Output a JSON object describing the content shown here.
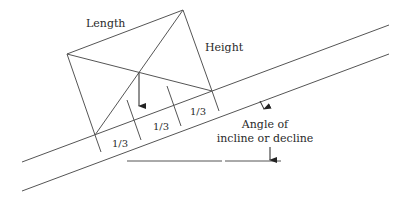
{
  "labels": {
    "length": "Length",
    "height": "Height",
    "third_1": "1/3",
    "third_2": "1/3",
    "third_3": "1/3",
    "angle_line1": "Angle of",
    "angle_line2": "incline or decline"
  },
  "colors": {
    "line": "#555555",
    "text": "#2a2a2a",
    "background": "#ffffff"
  }
}
